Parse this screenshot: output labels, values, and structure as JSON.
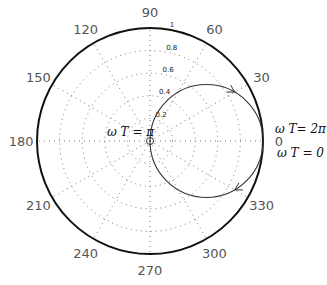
{
  "chart_data": {
    "type": "line",
    "coordinate_system": "polar",
    "title": "",
    "theta_ticks_deg": [
      0,
      30,
      60,
      90,
      120,
      150,
      180,
      210,
      240,
      270,
      300,
      330
    ],
    "theta_tick_labels": [
      "0",
      "30",
      "60",
      "90",
      "120",
      "150",
      "180",
      "210",
      "240",
      "270",
      "300",
      "330"
    ],
    "r_ticks": [
      0.2,
      0.4,
      0.6,
      0.8,
      1
    ],
    "r_tick_labels": [
      "0.2",
      "0.4",
      "0.6",
      "0.8",
      "1"
    ],
    "rlim": [
      0,
      1
    ],
    "grid": true,
    "series": [
      {
        "name": "locus",
        "description": "circle r = cos(theta), traversed clockwise from wT=0 to wT=2pi",
        "center_cartesian": [
          0.5,
          0
        ],
        "radius": 0.5,
        "direction": "clockwise",
        "arrow_marks_param_deg": [
          60,
          300
        ]
      }
    ],
    "markers": [
      {
        "name": "origin-point",
        "x": 0,
        "y": 0,
        "shape": "circle"
      }
    ],
    "annotations": [
      {
        "text": "ω T = π",
        "at": [
          0,
          0
        ]
      },
      {
        "text": "ω T= 2π",
        "at": [
          1,
          0
        ]
      },
      {
        "text": "ω T = 0",
        "at": [
          1,
          0
        ]
      }
    ]
  }
}
